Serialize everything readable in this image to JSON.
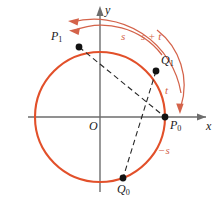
{
  "figure": {
    "type": "unit-circle-angle-addition-diagram",
    "colors": {
      "curve": "#e2502a",
      "arc_annotation": "#d4634a",
      "axis": "#6d6d6d",
      "chord": "#262626",
      "point": "#121212",
      "background": "#ffffff"
    },
    "axes": {
      "x_label": "x",
      "y_label": "y",
      "origin_label": "O"
    },
    "circle": {
      "center": [
        100,
        117
      ],
      "radius": 65
    },
    "points": [
      {
        "id": "P0",
        "label": "P",
        "sub": "0",
        "x": 165,
        "y": 117,
        "label_x": 170,
        "label_y": 122
      },
      {
        "id": "P1",
        "label": "P",
        "sub": "1",
        "x": 79,
        "y": 47,
        "label_x": 52,
        "label_y": 32
      },
      {
        "id": "Q1",
        "label": "Q",
        "sub": "1",
        "x": 156,
        "y": 71,
        "label_x": 161,
        "label_y": 57
      },
      {
        "id": "Q0",
        "label": "Q",
        "sub": "0",
        "x": 123,
        "y": 178,
        "label_x": 118,
        "label_y": 183
      }
    ],
    "arc_labels": [
      {
        "id": "s",
        "text": "s",
        "x": 122,
        "y": 36
      },
      {
        "id": "s_t",
        "text": "s + t",
        "x": 143,
        "y": 36
      },
      {
        "id": "t",
        "text": "t",
        "x": 166,
        "y": 90
      },
      {
        "id": "neg_s",
        "text": "−s",
        "x": 160,
        "y": 150
      }
    ],
    "chords": [
      {
        "from": "P1",
        "to": "P0"
      },
      {
        "from": "Q1",
        "to": "Q0"
      }
    ],
    "arcs": [
      {
        "id": "arc-s-plus-t",
        "desc": "outer arc from P0 counterclockwise past top, arrowhead left"
      },
      {
        "id": "arc-s",
        "desc": "inner arc ending at P1, arrowhead left"
      },
      {
        "id": "arc-t",
        "desc": "arc from top right down to P0 region, arrowhead down"
      }
    ]
  }
}
